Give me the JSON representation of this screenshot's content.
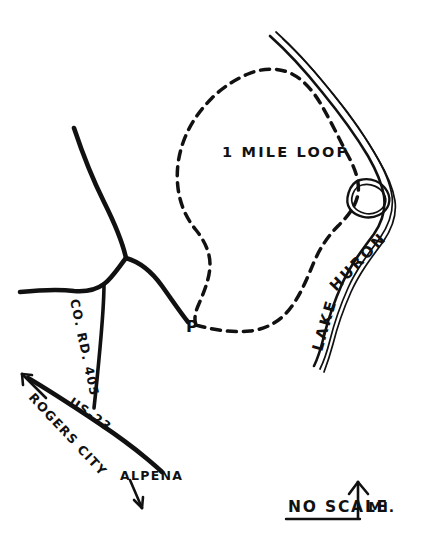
{
  "map": {
    "title": "Hand-drawn trail map",
    "background_color": "#ffffff",
    "ink_color": "#111111",
    "width": 448,
    "height": 551,
    "labels": {
      "trail_loop": "1 MILE LOOP",
      "lake": {
        "word_lake": "LAKE",
        "word_huron": "HURON",
        "full": "LAKE HURON"
      },
      "parking": "P",
      "county_road": "CO. RD. 405",
      "highway": "US-23",
      "city_northwest": "ROGERS CITY",
      "city_southeast": "ALPENA"
    },
    "scale_bar": {
      "text": "NO SCALE",
      "unit": "MI.",
      "north_arrow": "north-arrow"
    },
    "features": [
      {
        "name": "lake-huron-shoreline",
        "type": "water-edge"
      },
      {
        "name": "lake-inlet-island",
        "type": "island"
      },
      {
        "name": "one-mile-loop-trail",
        "type": "dashed-trail"
      },
      {
        "name": "county-road-405",
        "type": "road"
      },
      {
        "name": "us-23-highway",
        "type": "road"
      },
      {
        "name": "parking-area",
        "type": "point-of-interest"
      }
    ]
  }
}
